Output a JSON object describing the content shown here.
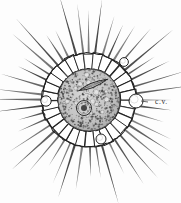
{
  "figure": {
    "background_color": "#fdfdfd",
    "ink_color": "#2b2b2b",
    "width": 181,
    "height": 203
  },
  "labels": [
    {
      "id": "cv",
      "text": "c.v.",
      "meaning": "contractile vacuole",
      "x": 155,
      "y": 104,
      "leader_from_x": 148,
      "leader_from_y": 102,
      "leader_to_x": 141,
      "leader_to_y": 101
    }
  ],
  "structures": {
    "center_x": 89,
    "center_y": 100,
    "axopodia": {
      "name": "axopodia-spines",
      "count": 44,
      "inner_radius": 46,
      "outer_radius_min": 74,
      "outer_radius_max": 112,
      "color": "#3a3a3a"
    },
    "cortex": {
      "name": "alveolar-cortex-layer",
      "outer_radius": 47,
      "inner_radius": 31,
      "chamber_count": 30,
      "stroke": "#222222",
      "fill": "#ffffff"
    },
    "endoplasm": {
      "name": "granular-endoplasm-core",
      "radius": 31,
      "fill": "#bdbdbd",
      "granule_count": 520
    },
    "nucleus": {
      "name": "nucleus",
      "cx": 84,
      "cy": 108,
      "r": 7.5,
      "nucleolus_r": 3.0
    },
    "diatom": {
      "name": "ingested-diatom",
      "cx": 93,
      "cy": 85,
      "length": 30,
      "width": 9,
      "rotation_deg": -22
    },
    "contractile_vacuoles": [
      {
        "name": "contractile-vacuole-right",
        "cx": 136,
        "cy": 101,
        "r": 7.0
      },
      {
        "name": "contractile-vacuole-left",
        "cx": 46,
        "cy": 101,
        "r": 5.2
      },
      {
        "name": "contractile-vacuole-bottom",
        "cx": 101,
        "cy": 139,
        "r": 5.0
      },
      {
        "name": "contractile-vacuole-topright",
        "cx": 124,
        "cy": 62,
        "r": 4.4
      }
    ]
  }
}
